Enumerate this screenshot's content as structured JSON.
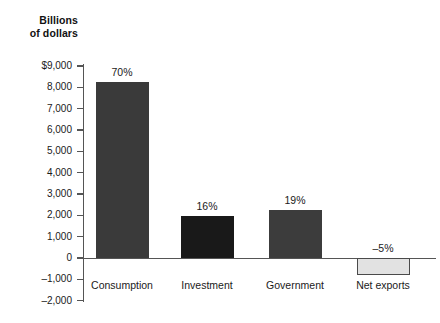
{
  "chart_data": {
    "type": "bar",
    "title": "",
    "ylabel": "Billions of dollars",
    "xlabel": "",
    "ylim": [
      -2000,
      9000
    ],
    "ytick_step": 1000,
    "grid": false,
    "legend": false,
    "categories": [
      "Consumption",
      "Investment",
      "Government",
      "Net exports"
    ],
    "values": [
      8250,
      1950,
      2250,
      -800
    ],
    "data_labels": [
      "70%",
      "16%",
      "19%",
      "–5%"
    ],
    "ytick_labels": [
      "$9,000",
      "8,000",
      "7,000",
      "6,000",
      "5,000",
      "4,000",
      "3,000",
      "2,000",
      "1,000",
      "0",
      "–1,000",
      "–2,000"
    ],
    "ytick_values": [
      9000,
      8000,
      7000,
      6000,
      5000,
      4000,
      3000,
      2000,
      1000,
      0,
      -1000,
      -2000
    ],
    "bar_colors": [
      "#3a3a3a",
      "#191919",
      "#3c3c3c",
      "#e2e2e2"
    ],
    "bar_border_colors": [
      "#3a3a3a",
      "#191919",
      "#3c3c3c",
      "#4a4a4a"
    ],
    "axis_color": "#555555",
    "background": "#ffffff"
  },
  "axis": {
    "title_line1": "Billions",
    "title_line2": "of dollars"
  }
}
